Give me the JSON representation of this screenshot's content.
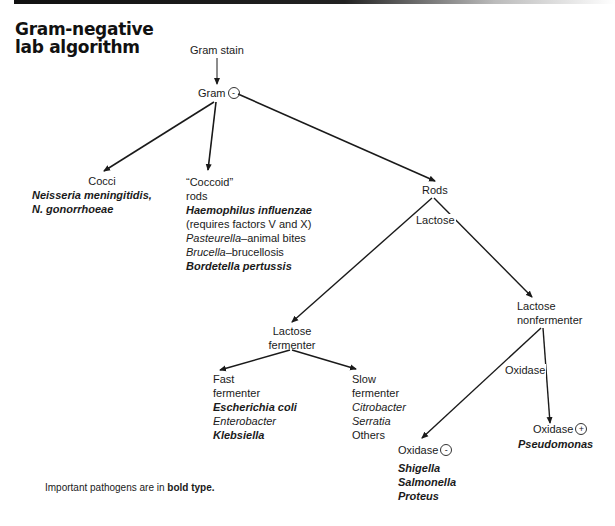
{
  "header": {
    "bar_color": "#111111",
    "title_line1": "Gram-negative",
    "title_line2": "lab algorithm"
  },
  "nodes": {
    "gram_stain": {
      "label": "Gram stain"
    },
    "gram_negative": {
      "label": "Gram",
      "sign": "-"
    },
    "cocci": {
      "label": "Cocci",
      "organisms": [
        {
          "name": "Neisseria meningitidis,",
          "style": "bold-italic"
        },
        {
          "name": "N. gonorrhoeae",
          "style": "bold-italic"
        }
      ]
    },
    "coccoid_rods": {
      "label_line1": "“Coccoid”",
      "label_line2": "rods",
      "organisms": [
        {
          "name": "Haemophilus influenzae",
          "style": "bold-italic"
        },
        {
          "name": "(requires factors V and X)",
          "style": "normal"
        },
        {
          "name": "Pasteurella",
          "suffix": "–animal bites",
          "style": "italic"
        },
        {
          "name": "Brucella",
          "suffix": "–brucellosis",
          "style": "italic"
        },
        {
          "name": "Bordetella pertussis",
          "style": "bold-italic"
        }
      ]
    },
    "rods": {
      "label": "Rods"
    },
    "lactose_fermenter": {
      "label_line1": "Lactose",
      "label_line2": "fermenter"
    },
    "lactose_nonfermenter": {
      "label_line1": "Lactose",
      "label_line2": "nonfermenter"
    },
    "fast_fermenter": {
      "label_line1": "Fast",
      "label_line2": "fermenter",
      "organisms": [
        {
          "name": "Escherichia coli",
          "style": "bold-italic"
        },
        {
          "name": "Enterobacter",
          "style": "italic"
        },
        {
          "name": "Klebsiella",
          "style": "bold-italic"
        }
      ]
    },
    "slow_fermenter": {
      "label_line1": "Slow",
      "label_line2": "fermenter",
      "organisms": [
        {
          "name": "Citrobacter",
          "style": "italic"
        },
        {
          "name": "Serratia",
          "style": "italic"
        },
        {
          "name": "Others",
          "style": "normal"
        }
      ]
    },
    "oxidase_negative": {
      "label": "Oxidase",
      "sign": "-",
      "organisms": [
        {
          "name": "Shigella",
          "style": "bold-italic"
        },
        {
          "name": "Salmonella",
          "style": "bold-italic"
        },
        {
          "name": "Proteus",
          "style": "bold-italic"
        }
      ]
    },
    "oxidase_positive": {
      "label": "Oxidase",
      "sign": "+",
      "organisms": [
        {
          "name": "Pseudomonas",
          "style": "bold-italic"
        }
      ]
    }
  },
  "edge_labels": {
    "lactose": "Lactose",
    "oxidase": "Oxidase"
  },
  "edges": [
    {
      "from": "gram_stain",
      "to": "gram_negative"
    },
    {
      "from": "gram_negative",
      "to": "cocci"
    },
    {
      "from": "gram_negative",
      "to": "coccoid_rods"
    },
    {
      "from": "gram_negative",
      "to": "rods"
    },
    {
      "from": "rods",
      "to": "lactose_fermenter",
      "label": "Lactose"
    },
    {
      "from": "rods",
      "to": "lactose_nonfermenter",
      "label": "Lactose"
    },
    {
      "from": "lactose_fermenter",
      "to": "fast_fermenter"
    },
    {
      "from": "lactose_fermenter",
      "to": "slow_fermenter"
    },
    {
      "from": "lactose_nonfermenter",
      "to": "oxidase_negative",
      "label": "Oxidase"
    },
    {
      "from": "lactose_nonfermenter",
      "to": "oxidase_positive",
      "label": "Oxidase"
    }
  ],
  "footnote": {
    "prefix": "Important pathogens are in ",
    "bold": "bold type."
  }
}
